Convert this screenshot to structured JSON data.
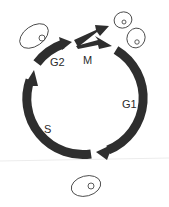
{
  "diagram": {
    "phases": [
      {
        "id": "g1",
        "label": "G1"
      },
      {
        "id": "s",
        "label": "S"
      },
      {
        "id": "g2",
        "label": "G2"
      },
      {
        "id": "m",
        "label": "M"
      }
    ],
    "cells": [
      {
        "id": "cell-g2",
        "description": "enlarged cell before mitosis"
      },
      {
        "id": "cell-daughter-1",
        "description": "daughter cell after division"
      },
      {
        "id": "cell-daughter-2",
        "description": "daughter cell after division"
      },
      {
        "id": "cell-g1-start",
        "description": "cell at start of G1"
      }
    ],
    "colors": {
      "arrow": "#2e2e2e",
      "cell_outline": "#4a4a4a",
      "background": "#ffffff"
    }
  }
}
